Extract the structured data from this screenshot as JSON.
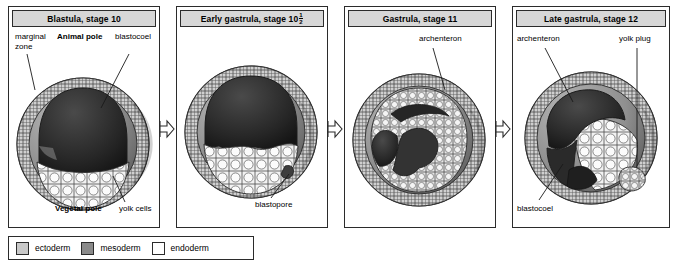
{
  "figure": {
    "colors": {
      "ectoderm": "#c9c9c9",
      "mesoderm": "#8a8a8a",
      "endoderm": "#ffffff",
      "cavity_dark": "#2e2e2e",
      "outline": "#2b2b2b",
      "header_bg": "#d7d7d7"
    }
  },
  "panels": [
    {
      "title": "Blastula, stage 10",
      "labels": [
        {
          "name": "marginal-zone",
          "text": "marginal\nzone",
          "bold": false
        },
        {
          "name": "animal-pole",
          "text": "Animal pole",
          "bold": true
        },
        {
          "name": "blastocoel",
          "text": "blastocoel",
          "bold": false
        },
        {
          "name": "vegetal-pole",
          "text": "Vegetal pole",
          "bold": true
        },
        {
          "name": "yolk-cells",
          "text": "yolk cells",
          "bold": false
        }
      ],
      "label_text": {
        "marginal_line1": "marginal",
        "marginal_line2": "zone",
        "animal_pole": "Animal pole",
        "blastocoel": "blastocoel",
        "vegetal_pole": "Vegetal pole",
        "yolk_cells": "yolk cells"
      }
    },
    {
      "title_prefix": "Early gastrula, stage 10",
      "title_fraction_numerator": "1",
      "title_fraction_denominator": "2",
      "title": "Early gastrula, stage 10 1/2",
      "label_text": {
        "blastopore": "blastopore"
      }
    },
    {
      "title": "Gastrula, stage 11",
      "label_text": {
        "archenteron": "archenteron"
      }
    },
    {
      "title": "Late gastrula, stage 12",
      "label_text": {
        "archenteron": "archenteron",
        "yolk_plug": "yolk plug",
        "blastocoel": "blastocoel"
      }
    }
  ],
  "arrows": [
    {
      "name": "arrow-stage10-to-stage10half"
    },
    {
      "name": "arrow-stage10half-to-stage11"
    },
    {
      "name": "arrow-stage11-to-stage12"
    }
  ],
  "legend": {
    "items": [
      {
        "label": "ectoderm",
        "color": "#c9c9c9"
      },
      {
        "label": "mesoderm",
        "color": "#8a8a8a"
      },
      {
        "label": "endoderm",
        "color": "#ffffff"
      }
    ]
  }
}
